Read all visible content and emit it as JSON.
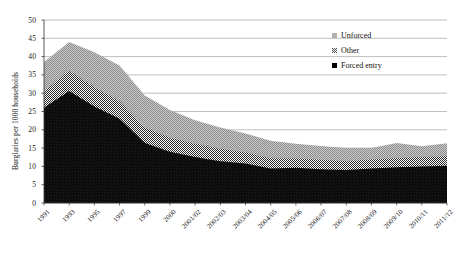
{
  "chart_data": {
    "type": "area",
    "stacked": true,
    "title": "",
    "xlabel": "",
    "ylabel": "Burglaries per 1000 households",
    "ylim": [
      0,
      50
    ],
    "ytick_step": 5,
    "yticks": [
      "0",
      "5",
      "10",
      "15",
      "20",
      "25",
      "30",
      "35",
      "40",
      "45",
      "50"
    ],
    "grid": true,
    "grid_axis": "y",
    "legend_position": "top-right",
    "categories": [
      "1991",
      "1993",
      "1995",
      "1997",
      "1999",
      "2000",
      "2001/02",
      "2002/03",
      "2003/04",
      "2004/05",
      "2005/06",
      "2006/07",
      "2007/08",
      "2008/09",
      "2009/10",
      "2010/11",
      "2011/12"
    ],
    "xtick_labels": [
      "1991",
      "1993",
      "1995",
      "1997",
      "1999",
      "2000",
      "2001/02",
      "2002/03",
      "2003/04",
      "2004/05",
      "2005/06",
      "2006/07",
      "2007/08",
      "2008/09",
      "2009/10",
      "2010/11",
      "2011/12"
    ],
    "series": [
      {
        "name": "Forced entry",
        "color": "#000000",
        "pattern": "solid",
        "values": [
          26.0,
          30.6,
          26.4,
          23.0,
          16.4,
          14.0,
          12.6,
          11.4,
          10.8,
          9.4,
          9.6,
          9.2,
          9.0,
          9.4,
          9.8,
          10.0,
          10.2
        ]
      },
      {
        "name": "Other",
        "color": "#4a4a4a",
        "pattern": "checker",
        "values": [
          4.5,
          5.5,
          5.2,
          4.8,
          4.2,
          3.8,
          3.6,
          3.4,
          3.0,
          2.8,
          2.6,
          2.6,
          2.4,
          2.5,
          2.5,
          2.6,
          2.6
        ]
      },
      {
        "name": "Unforced",
        "color": "#b0b0b0",
        "pattern": "solid-gray",
        "values": [
          8.0,
          7.9,
          9.6,
          9.8,
          8.8,
          7.6,
          6.4,
          5.8,
          5.2,
          4.8,
          4.0,
          3.8,
          3.6,
          3.1,
          4.1,
          2.9,
          3.5
        ]
      }
    ],
    "stack_totals": [
      38.5,
      44.0,
      41.2,
      37.6,
      29.4,
      25.4,
      22.6,
      20.6,
      19.0,
      17.0,
      16.2,
      15.6,
      15.0,
      15.0,
      16.4,
      15.5,
      16.3
    ],
    "legend": [
      {
        "label": "Unforced",
        "swatch": "light-gray-square"
      },
      {
        "label": "Other",
        "swatch": "checkered-square"
      },
      {
        "label": "Forced entry",
        "swatch": "black-square"
      }
    ]
  }
}
